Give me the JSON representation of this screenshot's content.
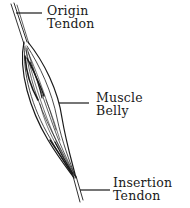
{
  "diagram": {
    "labels": {
      "origin": {
        "line1": "Origin",
        "line2": "Tendon"
      },
      "belly": {
        "line1": "Muscle",
        "line2": "Belly"
      },
      "insertion": {
        "line1": "Insertion",
        "line2": "Tendon"
      }
    },
    "colors": {
      "ink": "#1a1a1a",
      "background": "#ffffff"
    }
  }
}
